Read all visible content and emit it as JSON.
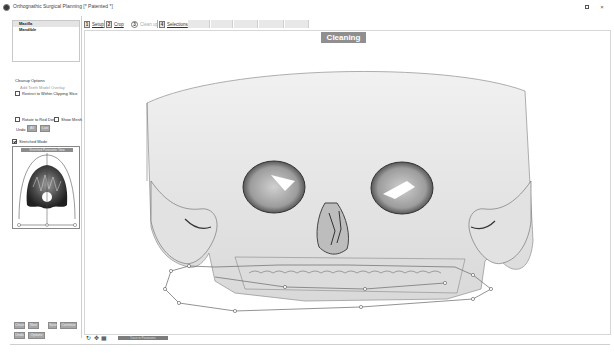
{
  "window": {
    "title": "Orthognathic Surgical Planning [* Patented *]",
    "restore_icon": "restore-icon",
    "close_label": "×"
  },
  "model_list": {
    "items": [
      {
        "label": "Maxilla",
        "selected": true
      },
      {
        "label": "Mandible",
        "selected": false
      }
    ]
  },
  "cleanup": {
    "header": "Cleanup Options",
    "sub_label": "Add Teeth Model Overlay",
    "restrict_checkbox": {
      "label": "Restrict to Within Clipping Slice",
      "checked": false
    },
    "rotate_checkbox": {
      "label": "Rotate to Red Dot",
      "checked": false
    },
    "show_mesh_checkbox": {
      "label": "Show Mesh",
      "checked": false
    },
    "undo_label": "Undo",
    "undo_buttons": [
      "All",
      "Last"
    ],
    "stretched_checkbox": {
      "label": "Stretched Mode",
      "checked": true
    },
    "mini_view_header": "Stretched Panoramic View"
  },
  "bottom_buttons": {
    "row1": [
      "Clean",
      "Next",
      "Save",
      "Continue"
    ],
    "row2": [
      "Undo",
      "Options"
    ]
  },
  "tabs": [
    {
      "num": "1",
      "label": "Setup",
      "active": true
    },
    {
      "num": "2",
      "label": "Crop",
      "active": true
    },
    {
      "num": "3",
      "label": "Clean up",
      "active": false,
      "current": true
    },
    {
      "num": "4",
      "label": "Selections",
      "active": true
    }
  ],
  "viewport": {
    "mode_label": "Cleaning"
  },
  "bottom_bar": {
    "icons": [
      "rotate-icon",
      "pan-icon",
      "grid-icon"
    ],
    "progress_label": "Trace in Panoramic"
  }
}
